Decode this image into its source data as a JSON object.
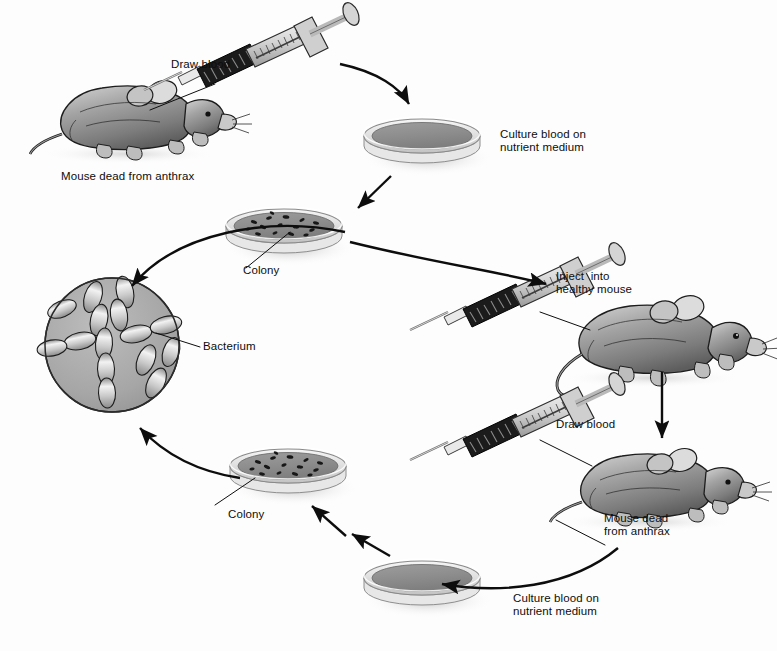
{
  "figure": {
    "background_color": "#fdfdfd",
    "ink_color": "#0d0d0d",
    "microscope_field_color": "#a8a8a8",
    "medium_color": "#8f8f8f",
    "dish_rim_color": "#d8d8d8"
  },
  "labels": {
    "draw_blood_top": "Draw blood",
    "mouse_dead_top": "Mouse dead from anthrax",
    "culture_top": "Culture blood on\nnutrient medium",
    "colony_top": "Colony",
    "bacterium": "Bacterium",
    "inject": "Inject  into\nhealthy mouse",
    "draw_blood_bottom": "Draw blood",
    "mouse_dead_bottom": "Mouse dead\nfrom anthrax",
    "colony_bottom": "Colony",
    "culture_bottom": "Culture blood on\nnutrient medium"
  },
  "elements": {
    "mouse_dead_top": "dead-mouse-illustration",
    "syringe_top": "syringe-illustration",
    "dish_culture_top": "petri-dish-plain-medium",
    "dish_colony_top": "petri-dish-with-colonies",
    "microscope_view": "microscope-field-with-bacteria",
    "syringe_inject": "syringe-illustration",
    "mouse_healthy": "healthy-mouse-illustration",
    "syringe_bottom": "syringe-illustration",
    "mouse_dead_bottom": "dead-mouse-illustration",
    "dish_culture_bottom": "petri-dish-plain-medium",
    "dish_colony_bottom": "petri-dish-with-colonies"
  },
  "flow": {
    "steps": [
      "Draw blood from mouse dead from anthrax",
      "Culture blood on nutrient medium",
      "Colony grows on plate",
      "Observe bacterium under microscope",
      "Inject into healthy mouse",
      "Mouse dead from anthrax",
      "Draw blood",
      "Culture blood on nutrient medium",
      "Colony grows on plate",
      "Observe bacterium under microscope"
    ],
    "arrow_count": 9
  }
}
